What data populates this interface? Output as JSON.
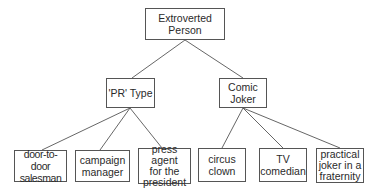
{
  "diagram": {
    "type": "tree",
    "root": {
      "label": "Extroverted\nPerson",
      "children": [
        {
          "label": "'PR' Type",
          "children": [
            {
              "label": "door-to-door\nsalesman"
            },
            {
              "label": "campaign\nmanager"
            },
            {
              "label": "press agent\nfor the\npresident"
            }
          ]
        },
        {
          "label": "Comic\nJoker",
          "children": [
            {
              "label": "circus\nclown"
            },
            {
              "label": "TV\ncomedian"
            },
            {
              "label": "practical\njoker in a\nfraternity"
            }
          ]
        }
      ]
    }
  }
}
